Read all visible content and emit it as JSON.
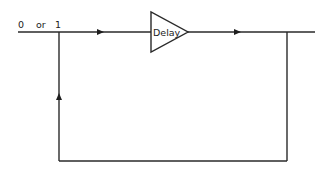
{
  "diagram": {
    "type": "feedback-loop",
    "input_label": "0 or 1",
    "input_label_parts": {
      "zero": "0",
      "or": "or",
      "one": "1"
    },
    "block": {
      "label": "Delay",
      "shape": "triangle"
    },
    "arrows": [
      {
        "position": "input-line",
        "direction": "right"
      },
      {
        "position": "output-line",
        "direction": "right"
      },
      {
        "position": "feedback-left-vertical",
        "direction": "up"
      }
    ],
    "colors": {
      "line": "#2a2a2a",
      "background": "#ffffff"
    }
  }
}
